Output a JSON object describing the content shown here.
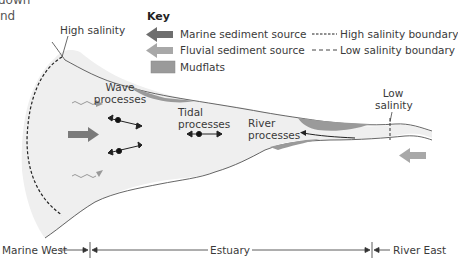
{
  "fragment": {
    "line1": "down",
    "line2": "nd"
  },
  "key": {
    "title": "Key",
    "items": [
      {
        "label": "Marine sediment source",
        "symbol": "dark-arrow-left",
        "color": "#6e6e6e"
      },
      {
        "label": "Fluvial sediment source",
        "symbol": "light-arrow-left",
        "color": "#a8a8a8"
      },
      {
        "label": "Mudflats",
        "symbol": "swatch",
        "color": "#9a9a9a"
      },
      {
        "label": "High salinity boundary",
        "symbol": "dense-dash"
      },
      {
        "label": "Low salinity boundary",
        "symbol": "sparse-dash"
      }
    ]
  },
  "labels": {
    "high_salinity": "High salinity",
    "low_salinity_1": "Low",
    "low_salinity_2": "salinity",
    "wave_1": "Wave",
    "wave_2": "processes",
    "tidal_1": "Tidal",
    "tidal_2": "processes",
    "river_1": "River",
    "river_2": "processes"
  },
  "scale_bar": {
    "left": "Marine West",
    "middle": "Estuary",
    "right": "River East"
  },
  "colors": {
    "water": "#efefef",
    "outline": "#555555",
    "mudflat": "#9a9a9a",
    "marine_arrow": "#6e6e6e",
    "fluvial_arrow": "#a8a8a8"
  }
}
